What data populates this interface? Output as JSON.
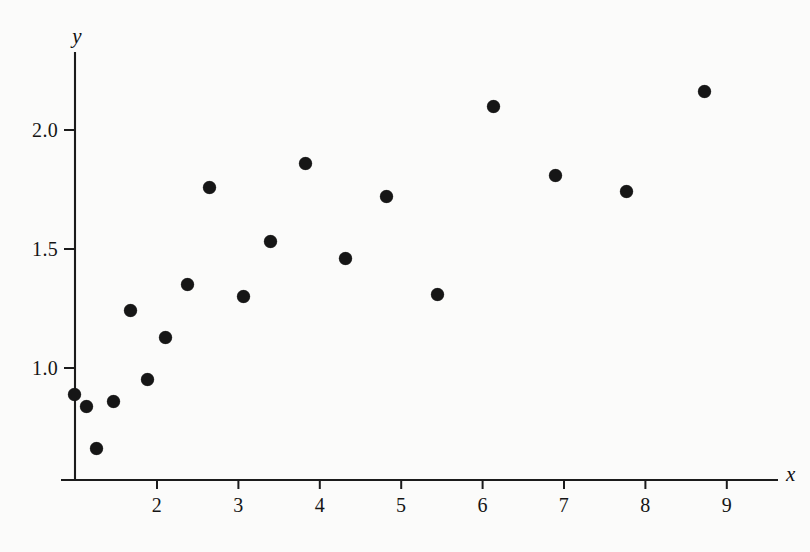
{
  "figure": {
    "background_color": "#fbfbfa",
    "ink_color": "#161616",
    "width": 810,
    "height": 552
  },
  "axes": {
    "x_axis_label": "x",
    "y_axis_label": "y",
    "x_ticks": [
      "2",
      "3",
      "4",
      "5",
      "6",
      "7",
      "8",
      "9"
    ],
    "y_ticks": [
      "1.0",
      "1.5",
      "2.0"
    ]
  },
  "chart_data": {
    "type": "scatter",
    "title": "",
    "xlabel": "x",
    "ylabel": "y",
    "grid": false,
    "legend": false,
    "xlim": [
      0.0,
      9.6
    ],
    "ylim": [
      0.55,
      2.35
    ],
    "x_tick_values": [
      2,
      3,
      4,
      5,
      6,
      7,
      8,
      9
    ],
    "y_tick_values": [
      1.0,
      1.5,
      2.0
    ],
    "marker": "filled-circle",
    "marker_color": "#161616",
    "n_points": 19,
    "points": [
      {
        "x": 0.99,
        "y": 0.89
      },
      {
        "x": 1.14,
        "y": 0.84
      },
      {
        "x": 1.26,
        "y": 0.66
      },
      {
        "x": 1.47,
        "y": 0.86
      },
      {
        "x": 1.67,
        "y": 1.24
      },
      {
        "x": 1.88,
        "y": 0.95
      },
      {
        "x": 2.11,
        "y": 1.13
      },
      {
        "x": 2.38,
        "y": 1.35
      },
      {
        "x": 2.65,
        "y": 1.76
      },
      {
        "x": 3.06,
        "y": 1.3
      },
      {
        "x": 3.39,
        "y": 1.53
      },
      {
        "x": 3.82,
        "y": 1.86
      },
      {
        "x": 4.31,
        "y": 1.46
      },
      {
        "x": 4.82,
        "y": 1.72
      },
      {
        "x": 5.44,
        "y": 1.31
      },
      {
        "x": 6.13,
        "y": 2.1
      },
      {
        "x": 6.89,
        "y": 1.81
      },
      {
        "x": 7.77,
        "y": 1.74
      },
      {
        "x": 8.73,
        "y": 2.16
      }
    ]
  },
  "geometry": {
    "origin_px": {
      "x": 75,
      "y": 480
    },
    "x_axis_end_px": 778,
    "y_axis_top_px": 52,
    "px_per_x_unit": 81.4,
    "px_per_y_unit": 238,
    "x_value_at_origin_px": -5.8,
    "y_one_px": 368
  }
}
